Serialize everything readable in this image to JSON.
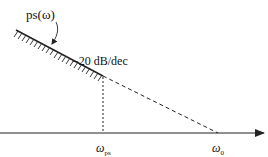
{
  "diagram": {
    "type": "asymptotic bode magnitude sketch",
    "curve_label": "ps(ω)",
    "slope_label": "−20 dB/dec",
    "axis": {
      "ticks": [
        {
          "symbol": "ω",
          "subscript": "ps"
        },
        {
          "symbol": "ω",
          "subscript": "0"
        }
      ]
    },
    "colors": {
      "line": "#222222",
      "background": "#ffffff"
    }
  }
}
